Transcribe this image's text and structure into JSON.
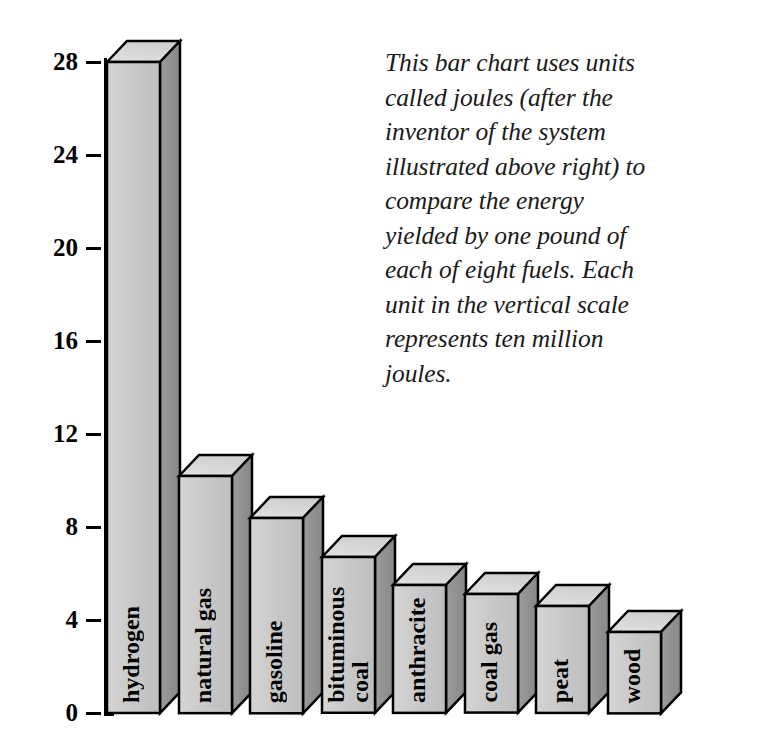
{
  "caption": {
    "text": "This bar chart uses units\ncalled joules (after the\ninventor of the system\nillustrated above right) to\ncompare the energy\nyielded by one pound of\neach of eight fuels. Each\nunit in the vertical scale\nrepresents ten million\njoules."
  },
  "chart_data": {
    "type": "bar",
    "title": "",
    "xlabel": "",
    "ylabel": "",
    "ylim": [
      0,
      28
    ],
    "yticks": [
      0,
      4,
      8,
      12,
      16,
      20,
      24,
      28
    ],
    "ytick_labels": [
      "0",
      "4",
      "8",
      "12",
      "16",
      "20",
      "24",
      "28"
    ],
    "grid": false,
    "legend": "none",
    "unit_note": "Each unit in the vertical scale represents ten million joules.",
    "categories": [
      "hydrogen",
      "natural gas",
      "gasoline",
      "bituminous\ncoal",
      "anthracite",
      "coal gas",
      "peat",
      "wood"
    ],
    "values": [
      28.0,
      10.2,
      8.4,
      6.7,
      5.5,
      5.1,
      4.6,
      3.5
    ]
  },
  "colors": {
    "bar_front": "#c6c6c6",
    "bar_side": "#8f8f8f",
    "bar_top": "#dcdcdc",
    "outline": "#000000",
    "text": "#000000",
    "background": "#ffffff"
  }
}
